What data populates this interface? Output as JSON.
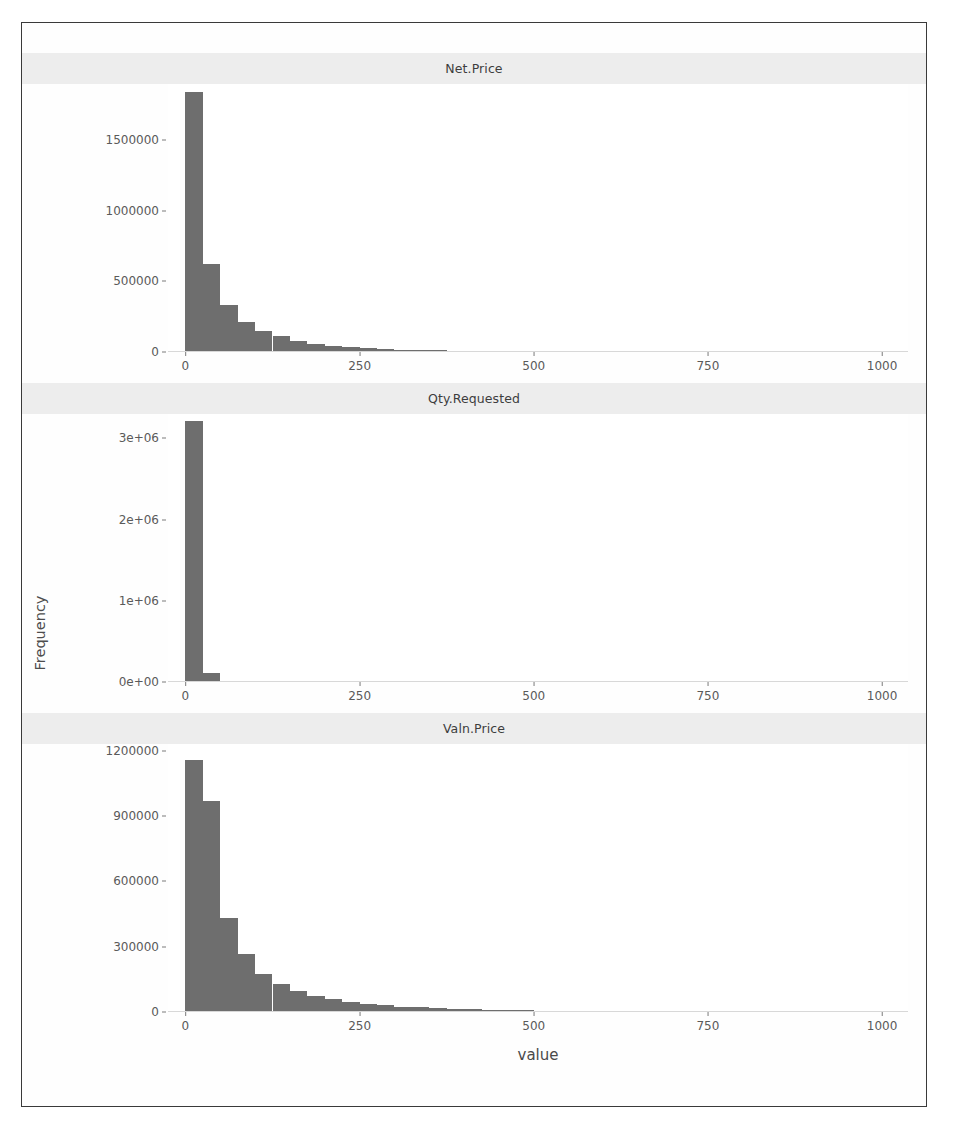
{
  "figure": {
    "ylabel": "Frequency",
    "xlabel": "value",
    "bar_color": "#6e6e6e",
    "strip_color": "#ededed",
    "panel_bg": "#ffffff",
    "border_color": "#3a3a3a"
  },
  "axis": {
    "x_ticks": [
      "0",
      "250",
      "500",
      "750",
      "1000"
    ],
    "x_tick_values": [
      0,
      250,
      500,
      750,
      1000
    ]
  },
  "panels": [
    {
      "title": "Net.Price",
      "y_ticks": [
        "0",
        "500000",
        "1000000",
        "1500000"
      ],
      "y_tick_values": [
        0,
        500000,
        1000000,
        1500000
      ]
    },
    {
      "title": "Qty.Requested",
      "y_ticks": [
        "0e+00",
        "1e+06",
        "2e+06",
        "3e+06"
      ],
      "y_tick_values": [
        0,
        1000000,
        2000000,
        3000000
      ]
    },
    {
      "title": "Valn.Price",
      "y_ticks": [
        "0",
        "300000",
        "600000",
        "900000",
        "1200000"
      ],
      "y_tick_values": [
        0,
        300000,
        600000,
        900000,
        1200000
      ]
    }
  ],
  "chart_data": {
    "type": "bar",
    "subtype": "histogram-facet-grid",
    "title": "",
    "xlabel": "value",
    "ylabel": "Frequency",
    "grid": false,
    "legend": "none",
    "facet_layout": "3 rows x 1 column, free y scale, shared x scale",
    "xlim": [
      -25,
      1040
    ],
    "bin_width": 25,
    "panels": [
      {
        "name": "Net.Price",
        "ylim": [
          0,
          1900000
        ],
        "y_ticks": [
          0,
          500000,
          1000000,
          1500000
        ],
        "bin_starts": [
          0,
          25,
          50,
          75,
          100,
          125,
          150,
          175,
          200,
          225,
          250,
          275,
          300,
          325,
          350,
          375,
          400,
          425,
          450,
          475,
          500,
          525,
          550,
          575,
          600,
          625,
          650,
          675,
          700,
          725,
          750,
          775,
          800,
          825,
          850,
          875,
          900,
          925,
          950,
          975
        ],
        "values": [
          1840000,
          625000,
          330000,
          215000,
          150000,
          112000,
          80000,
          58000,
          42000,
          33000,
          26000,
          21000,
          17000,
          14000,
          12000,
          10000,
          8500,
          7200,
          6200,
          5400,
          4700,
          4100,
          3600,
          3200,
          2900,
          2600,
          2300,
          2100,
          1900,
          1750,
          1600,
          1500,
          1400,
          1300,
          1200,
          1100,
          1000,
          950,
          900,
          850
        ]
      },
      {
        "name": "Qty.Requested",
        "ylim": [
          0,
          3300000
        ],
        "y_ticks": [
          0,
          1000000,
          2000000,
          3000000
        ],
        "bin_starts": [
          0,
          25
        ],
        "values": [
          3220000,
          105000
        ]
      },
      {
        "name": "Valn.Price",
        "ylim": [
          0,
          1230000
        ],
        "y_ticks": [
          0,
          300000,
          600000,
          900000,
          1200000
        ],
        "bin_starts": [
          0,
          25,
          50,
          75,
          100,
          125,
          150,
          175,
          200,
          225,
          250,
          275,
          300,
          325,
          350,
          375,
          400,
          425,
          450,
          475,
          500,
          525,
          550,
          575,
          600,
          625,
          650,
          675,
          700,
          725,
          750,
          775,
          800,
          825,
          850,
          875,
          900
        ],
        "values": [
          1155000,
          970000,
          430000,
          265000,
          175000,
          128000,
          96000,
          74000,
          58000,
          47000,
          38000,
          31000,
          25000,
          21000,
          17500,
          14500,
          12000,
          10000,
          8500,
          7200,
          6000,
          5200,
          4400,
          3800,
          3300,
          2900,
          2500,
          2200,
          1900,
          1700,
          1500,
          1300,
          1150,
          1000,
          900,
          800,
          700
        ]
      }
    ]
  }
}
